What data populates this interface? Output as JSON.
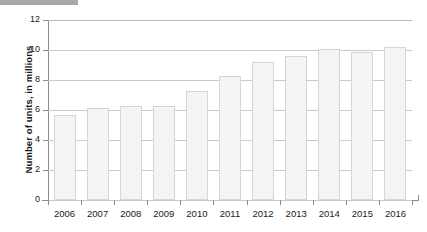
{
  "overlay": {
    "redaction_label": "redacted-bar"
  },
  "chart_data": {
    "type": "bar",
    "title": "",
    "xlabel": "",
    "ylabel": "Number of units, in millions",
    "categories": [
      "2006",
      "2007",
      "2008",
      "2009",
      "2010",
      "2011",
      "2012",
      "2013",
      "2014",
      "2015",
      "2016"
    ],
    "values": [
      5.65,
      6.15,
      6.25,
      6.25,
      7.25,
      8.3,
      9.2,
      9.6,
      10.1,
      9.9,
      10.2
    ],
    "ylim": [
      0,
      12
    ],
    "ytick_labels": [
      "0",
      "2",
      "4",
      "6",
      "8",
      "10",
      "12"
    ],
    "ytick_values": [
      0,
      2,
      4,
      6,
      8,
      10,
      12
    ],
    "grid": true,
    "legend": "none",
    "bar_color": "#f4f4f4",
    "bar_border_color": "#d6d6d6",
    "grid_color": "#c9c9c9",
    "axis_color": "#8c8c8c"
  }
}
